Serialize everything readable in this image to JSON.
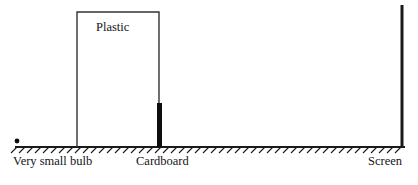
{
  "figure": {
    "background_color": "#ffffff",
    "stroke_color": "#1a1a1a",
    "fill_color": "#0d0d0d",
    "labels": {
      "bulb": "Very small bulb",
      "cardboard": "Cardboard",
      "screen": "Screen",
      "plastic": "Plastic"
    },
    "elements": {
      "ground": {
        "name": "ground-baseline",
        "x_start": 15,
        "x_end": 405,
        "y": 147,
        "hatch_count": 49,
        "hatch_spacing": 8,
        "hatch_length": 6
      },
      "bulb": {
        "name": "very-small-bulb",
        "cx": 17,
        "cy": 141,
        "r": 2.4
      },
      "plastic_box": {
        "name": "plastic-enclosure",
        "x": 77,
        "y": 12,
        "width": 82,
        "height": 135
      },
      "cardboard": {
        "name": "cardboard-barrier",
        "x": 157,
        "y": 103,
        "width": 5,
        "height": 44
      },
      "screen": {
        "name": "screen-plane",
        "x": 402,
        "y_top": 5,
        "y_bottom": 147,
        "thickness": 3
      }
    }
  }
}
